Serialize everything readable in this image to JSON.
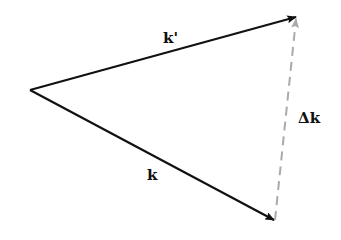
{
  "diagram": {
    "type": "vector-triangle",
    "origin": {
      "x": 30,
      "y": 90
    },
    "vectors": [
      {
        "id": "k_prime",
        "label": "k'",
        "from": [
          30,
          90
        ],
        "to": [
          297,
          17
        ],
        "color": "#111111",
        "style": "solid"
      },
      {
        "id": "k",
        "label": "k",
        "from": [
          30,
          90
        ],
        "to": [
          275,
          221
        ],
        "color": "#111111",
        "style": "solid"
      },
      {
        "id": "delta_k",
        "label": "Δk",
        "from": [
          275,
          220
        ],
        "to": [
          297,
          18
        ],
        "color": "#aaaaaa",
        "style": "dashed"
      }
    ],
    "labels": {
      "k_prime": "k'",
      "k": "k",
      "delta_k": "Δk"
    }
  }
}
